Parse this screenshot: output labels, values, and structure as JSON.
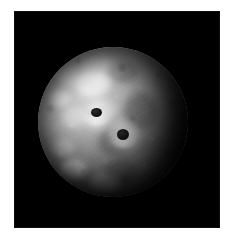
{
  "page": {
    "background_color": "#ffffff",
    "width": 226,
    "height": 236
  },
  "image_panel": {
    "background_color": "#000000",
    "alt_description": "Grayscale spacecraft photograph of an icy moon against black space",
    "x": 14,
    "y": 11,
    "width": 206,
    "height": 217
  },
  "subject": {
    "name": "moon-disk",
    "body_type": "icy moon",
    "illumination": "lit from upper-left, terminator shading on right limb",
    "center_x": 113,
    "center_y": 122,
    "radius": 75,
    "surface_color_bright": "#d8d8d8",
    "surface_color_mid": "#9d9d9d",
    "surface_color_dark": "#373737",
    "space_color": "#000000"
  },
  "features": {
    "craters": [
      {
        "name": "dark-floor-crater-upper",
        "x": 93,
        "y": 117,
        "diameter": 9,
        "floor_color": "#151515",
        "has_bright_rays": true
      },
      {
        "name": "dark-floor-crater-lower",
        "x": 119,
        "y": 136,
        "diameter": 10,
        "floor_color": "#1a1a1a",
        "has_bright_rays": true
      }
    ],
    "bright_patches": [
      {
        "name": "highland-patch-upper-left",
        "x": 86,
        "y": 68
      },
      {
        "name": "highland-patch-north",
        "x": 104,
        "y": 57
      },
      {
        "name": "highland-patch-west",
        "x": 60,
        "y": 86
      },
      {
        "name": "highland-patch-lower-left",
        "x": 70,
        "y": 162
      },
      {
        "name": "highland-patch-south",
        "x": 99,
        "y": 178
      }
    ],
    "dark_regions": [
      {
        "name": "terminator-shadow-east-limb",
        "x": 170,
        "y": 120
      },
      {
        "name": "shadow-south-limb",
        "x": 120,
        "y": 195
      }
    ]
  }
}
